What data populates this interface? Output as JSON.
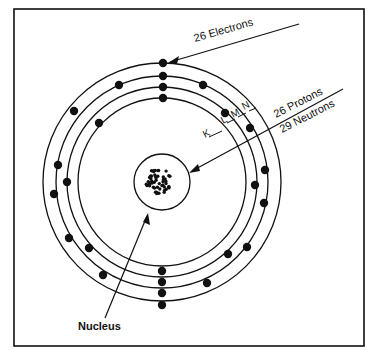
{
  "labels": {
    "electrons": "26 Electrons",
    "protons": "26 Protons",
    "neutrons": "29 Neutrons",
    "nucleus": "Nucleus",
    "shell_k": "K",
    "shell_l": "L",
    "shell_m": "M",
    "shell_n": "N"
  },
  "colors": {
    "ink": "#111111",
    "background": "#ffffff"
  },
  "nucleus": {
    "cx": 162,
    "cy": 182,
    "r": 28
  },
  "orbits": [
    {
      "name": "K",
      "r": 84
    },
    {
      "name": "L",
      "r": 95
    },
    {
      "name": "M",
      "r": 106
    },
    {
      "name": "N",
      "r": 119
    }
  ],
  "electrons": [
    [
      163,
      63
    ],
    [
      163,
      76
    ],
    [
      163,
      87
    ],
    [
      163,
      98
    ],
    [
      119,
      85
    ],
    [
      99,
      123
    ],
    [
      74,
      111
    ],
    [
      58,
      165
    ],
    [
      67,
      182
    ],
    [
      54,
      194
    ],
    [
      69,
      238
    ],
    [
      89,
      248
    ],
    [
      103,
      275
    ],
    [
      162,
      271
    ],
    [
      162,
      282
    ],
    [
      162,
      293
    ],
    [
      162,
      305
    ],
    [
      207,
      283
    ],
    [
      228,
      254
    ],
    [
      247,
      247
    ],
    [
      255,
      185
    ],
    [
      264,
      203
    ],
    [
      265,
      170
    ],
    [
      203,
      85
    ],
    [
      225,
      113
    ],
    [
      250,
      128
    ]
  ]
}
